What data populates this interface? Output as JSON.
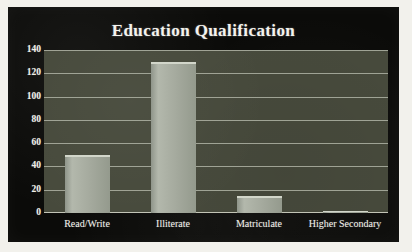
{
  "chart_data": {
    "type": "bar",
    "title": "Education Qualification",
    "xlabel": "",
    "ylabel": "",
    "categories": [
      "Read/Write",
      "Illiterate",
      "Matriculate",
      "Higher Secondary"
    ],
    "values": [
      50,
      130,
      15,
      2
    ],
    "ylim": [
      0,
      140
    ],
    "yticks": [
      0,
      20,
      40,
      60,
      80,
      100,
      120,
      140
    ],
    "ytick_labels": [
      "0",
      "20",
      "40",
      "60",
      "80",
      "100",
      "120",
      "140"
    ],
    "grid": true,
    "legend": false,
    "colors": {
      "panel_background": "#0b0b09",
      "plot_background": "#474a3c",
      "bar_fill": "#a8aea2",
      "bar_highlight": "#d2d6ca",
      "gridline": "#b9bcae",
      "text": "#efeee8",
      "page_background": "#f2f1ec"
    }
  }
}
